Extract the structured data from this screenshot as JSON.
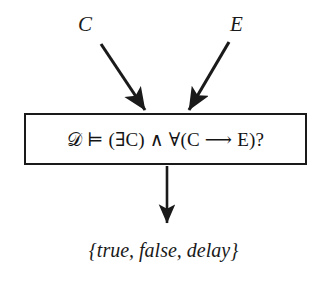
{
  "figure": {
    "kind": "flow-diagram",
    "background_color": "#ffffff",
    "ink_color": "#1a1a1a"
  },
  "inputs": [
    {
      "id": "c",
      "label": "C",
      "name": "input-label-c"
    },
    {
      "id": "e",
      "label": "E",
      "name": "input-label-e"
    }
  ],
  "process": {
    "formula": "𝒟 ⊨ (∃C) ∧ ∀(C ⟶ E)?",
    "border_color": "#1a1a1a",
    "fill_color": "#ffffff"
  },
  "output": {
    "set_text": "{true, false, delay}",
    "members": [
      "true",
      "false",
      "delay"
    ]
  },
  "arrows": [
    {
      "id": "c-to-box",
      "from": "C",
      "to": "query-box",
      "direction": "down-right"
    },
    {
      "id": "e-to-box",
      "from": "E",
      "to": "query-box",
      "direction": "down-left"
    },
    {
      "id": "box-to-output",
      "from": "query-box",
      "to": "output-set",
      "direction": "down"
    }
  ]
}
